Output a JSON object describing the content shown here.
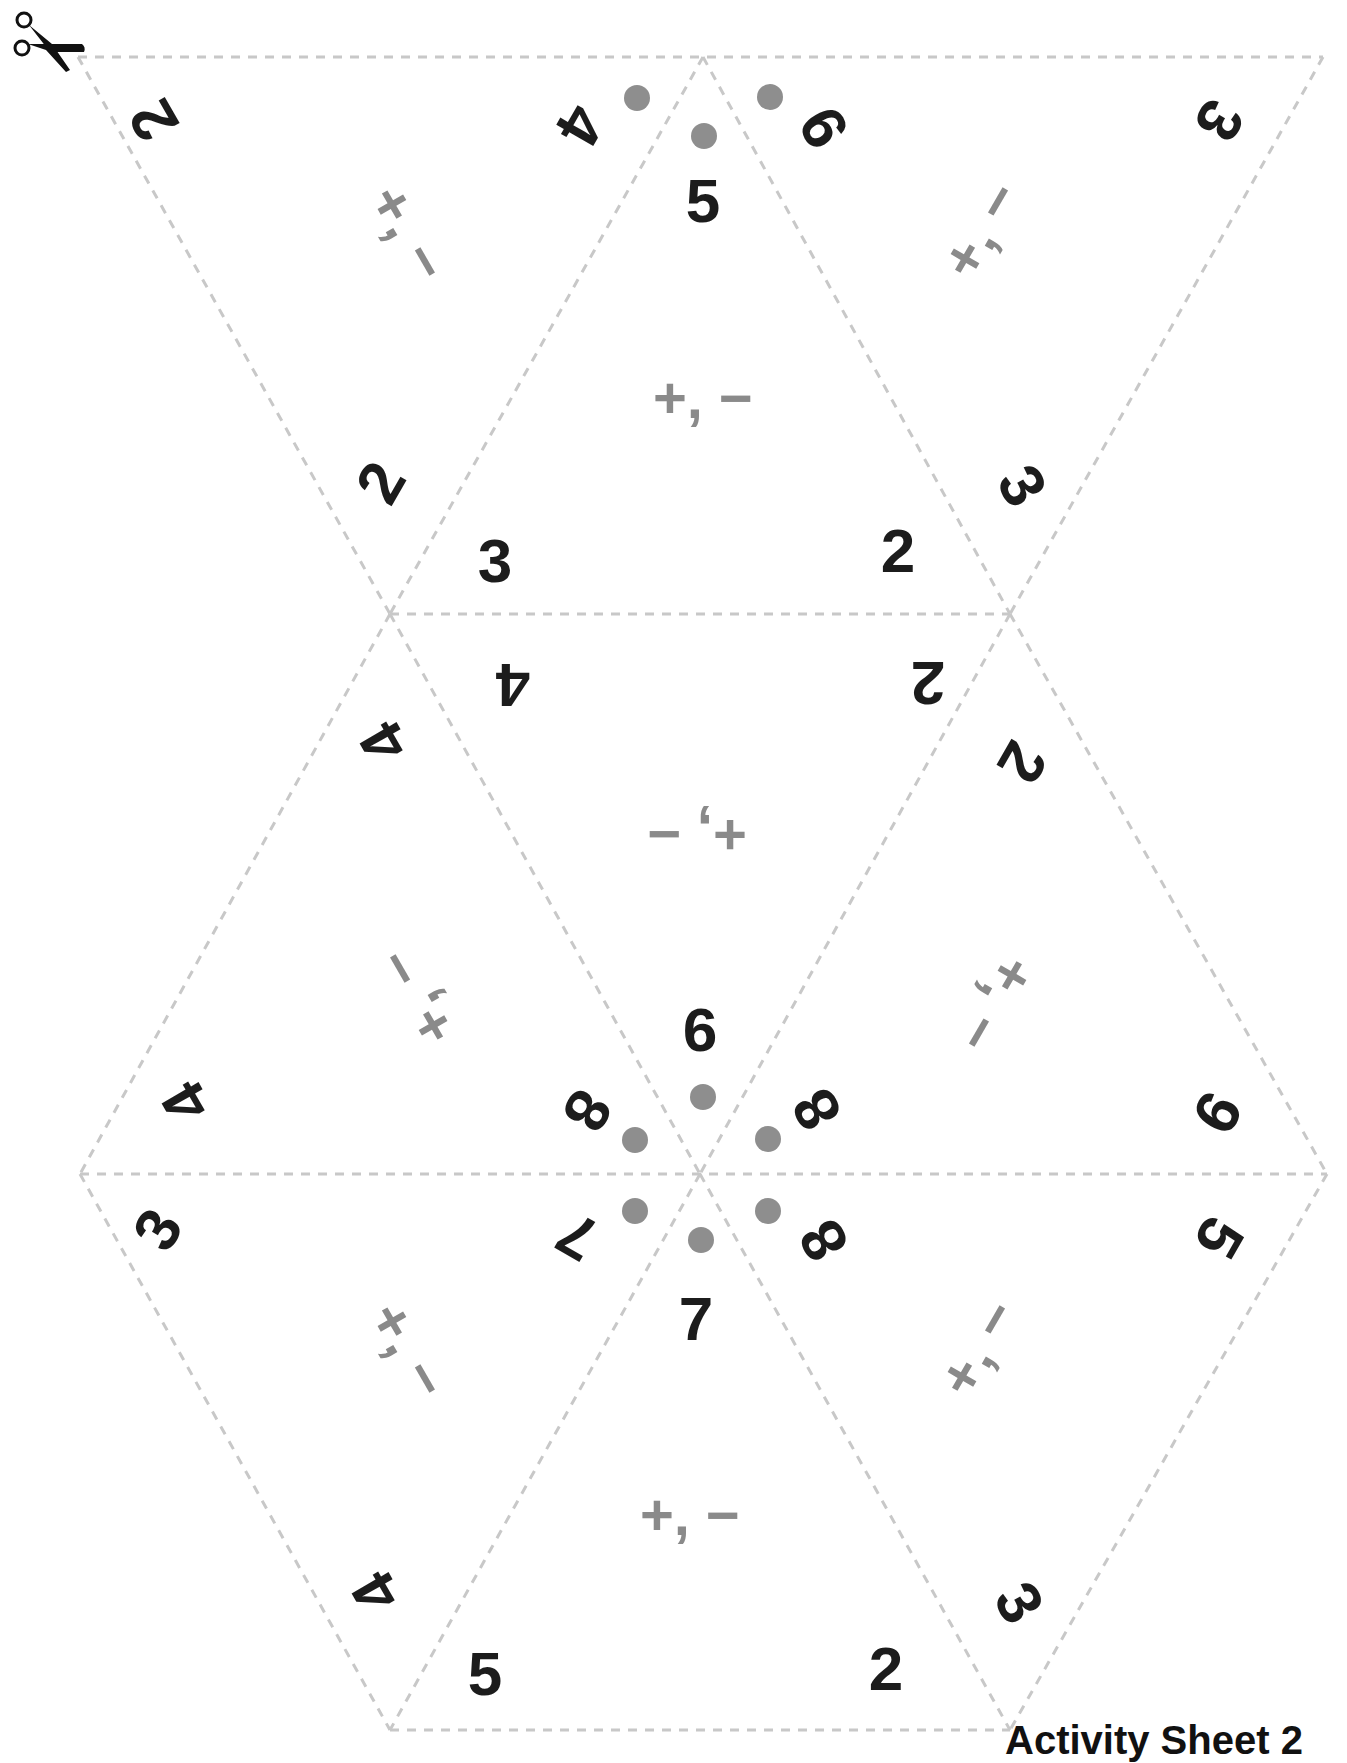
{
  "sheet": {
    "footer_label": "Activity Sheet 2",
    "scissors_icon": "scissors-icon",
    "colors": {
      "number": "#1c1c1c",
      "operator": "#8a8a8a",
      "dot": "#8e8e8e",
      "cut_line": "#c8c8c8"
    }
  },
  "triangles": [
    {
      "id": "t1",
      "operators": "+, −",
      "corners": [
        "2",
        "4",
        "2"
      ]
    },
    {
      "id": "t2",
      "operators": "+, −",
      "corners": [
        "5",
        "3",
        "2"
      ]
    },
    {
      "id": "t3",
      "operators": "+, −",
      "corners": [
        "9",
        "3",
        "3"
      ]
    },
    {
      "id": "t4",
      "operators": "+, −",
      "corners": [
        "4",
        "2",
        "9"
      ]
    },
    {
      "id": "t5",
      "operators": "+, −",
      "corners": [
        "4",
        "8",
        "4"
      ]
    },
    {
      "id": "t6",
      "operators": "+, −",
      "corners": [
        "2",
        "8",
        "9"
      ]
    },
    {
      "id": "t7",
      "operators": "+, −",
      "corners": [
        "3",
        "7",
        "4"
      ]
    },
    {
      "id": "t8",
      "operators": "+, −",
      "corners": [
        "7",
        "5",
        "2"
      ]
    },
    {
      "id": "t9",
      "operators": "+, −",
      "corners": [
        "8",
        "5",
        "3"
      ]
    }
  ]
}
